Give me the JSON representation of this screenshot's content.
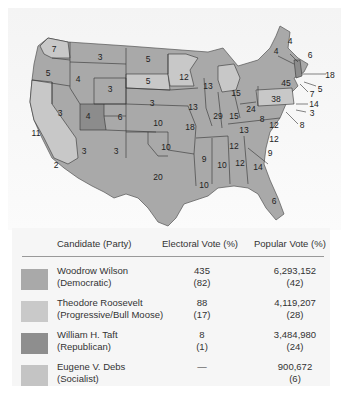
{
  "map": {
    "title": "Election of 1912",
    "colors": {
      "wilson": "#a9a9a9",
      "roosevelt": "#c8c8c8",
      "taft": "#8c8c8c",
      "debs": "#c4c4c4",
      "border": "#333333"
    },
    "state_labels": [
      {
        "state": "WA",
        "votes": "7",
        "candidate": "roosevelt"
      },
      {
        "state": "OR",
        "votes": "5",
        "candidate": "wilson"
      },
      {
        "state": "CA",
        "votes": "11",
        "candidate": "roosevelt"
      },
      {
        "state": "CA-south",
        "votes": "2",
        "candidate": "wilson"
      },
      {
        "state": "ID",
        "votes": "4",
        "candidate": "wilson"
      },
      {
        "state": "NV",
        "votes": "3",
        "candidate": "wilson"
      },
      {
        "state": "MT",
        "votes": "3",
        "candidate": "wilson"
      },
      {
        "state": "WY",
        "votes": "3",
        "candidate": "wilson"
      },
      {
        "state": "UT",
        "votes": "4",
        "candidate": "taft"
      },
      {
        "state": "CO",
        "votes": "6",
        "candidate": "wilson"
      },
      {
        "state": "AZ",
        "votes": "3",
        "candidate": "wilson"
      },
      {
        "state": "NM",
        "votes": "3",
        "candidate": "wilson"
      },
      {
        "state": "ND",
        "votes": "5",
        "candidate": "wilson"
      },
      {
        "state": "SD",
        "votes": "5",
        "candidate": "roosevelt"
      },
      {
        "state": "NE",
        "votes": "3",
        "candidate": "wilson"
      },
      {
        "state": "KS",
        "votes": "10",
        "candidate": "wilson"
      },
      {
        "state": "OK",
        "votes": "10",
        "candidate": "wilson"
      },
      {
        "state": "TX",
        "votes": "20",
        "candidate": "wilson"
      },
      {
        "state": "MN",
        "votes": "12",
        "candidate": "roosevelt"
      },
      {
        "state": "IA",
        "votes": "13",
        "candidate": "wilson"
      },
      {
        "state": "MO",
        "votes": "18",
        "candidate": "wilson"
      },
      {
        "state": "AR",
        "votes": "9",
        "candidate": "wilson"
      },
      {
        "state": "LA",
        "votes": "10",
        "candidate": "wilson"
      },
      {
        "state": "WI",
        "votes": "13",
        "candidate": "wilson"
      },
      {
        "state": "IL",
        "votes": "29",
        "candidate": "wilson"
      },
      {
        "state": "MI",
        "votes": "15",
        "candidate": "roosevelt"
      },
      {
        "state": "IN",
        "votes": "15",
        "candidate": "wilson"
      },
      {
        "state": "OH",
        "votes": "24",
        "candidate": "wilson"
      },
      {
        "state": "KY",
        "votes": "13",
        "candidate": "wilson"
      },
      {
        "state": "TN",
        "votes": "12",
        "candidate": "wilson"
      },
      {
        "state": "MS",
        "votes": "10",
        "candidate": "wilson"
      },
      {
        "state": "AL",
        "votes": "12",
        "candidate": "wilson"
      },
      {
        "state": "GA",
        "votes": "14",
        "candidate": "wilson"
      },
      {
        "state": "FL",
        "votes": "6",
        "candidate": "wilson"
      },
      {
        "state": "SC",
        "votes": "9",
        "candidate": "wilson"
      },
      {
        "state": "NC",
        "votes": "12",
        "candidate": "wilson"
      },
      {
        "state": "VA",
        "votes": "12",
        "candidate": "wilson"
      },
      {
        "state": "WV",
        "votes": "8",
        "candidate": "wilson"
      },
      {
        "state": "PA",
        "votes": "38",
        "candidate": "roosevelt"
      },
      {
        "state": "NY",
        "votes": "45",
        "candidate": "wilson"
      },
      {
        "state": "VT",
        "votes": "4",
        "candidate": "taft"
      },
      {
        "state": "NH",
        "votes": "4",
        "candidate": "wilson"
      },
      {
        "state": "ME",
        "votes": "6",
        "candidate": "wilson"
      },
      {
        "state": "MA",
        "votes": "18",
        "candidate": "wilson"
      },
      {
        "state": "RI",
        "votes": "5",
        "candidate": "wilson"
      },
      {
        "state": "CT",
        "votes": "7",
        "candidate": "wilson"
      },
      {
        "state": "NJ",
        "votes": "14",
        "candidate": "wilson"
      },
      {
        "state": "DE",
        "votes": "3",
        "candidate": "wilson"
      },
      {
        "state": "MD",
        "votes": "8",
        "candidate": "wilson"
      }
    ]
  },
  "table": {
    "headers": {
      "candidate": "Candidate (Party)",
      "electoral": "Electoral Vote (%)",
      "popular": "Popular Vote (%)"
    },
    "rows": [
      {
        "name": "Woodrow Wilson",
        "party": "(Democratic)",
        "ev": "435",
        "ev_pct": "(82)",
        "pv": "6,293,152",
        "pv_pct": "(42)",
        "color": "#a9a9a9"
      },
      {
        "name": "Theodore Roosevelt",
        "party": "(Progressive/Bull Moose)",
        "ev": "88",
        "ev_pct": "(17)",
        "pv": "4,119,207",
        "pv_pct": "(28)",
        "color": "#c9c9c9"
      },
      {
        "name": "William H. Taft",
        "party": "(Republican)",
        "ev": "8",
        "ev_pct": "(1)",
        "pv": "3,484,980",
        "pv_pct": "(24)",
        "color": "#8e8e8e"
      },
      {
        "name": "Eugene V. Debs",
        "party": "(Socialist)",
        "ev": "—",
        "ev_pct": "",
        "pv": "900,672",
        "pv_pct": "(6)",
        "color": "#c4c4c4"
      }
    ]
  }
}
